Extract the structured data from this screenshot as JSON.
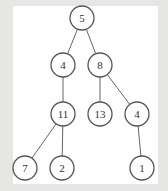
{
  "diagram": {
    "type": "binary-tree",
    "nodes": [
      {
        "id": "n5",
        "label": "5",
        "x": 82,
        "y": 18
      },
      {
        "id": "n4a",
        "label": "4",
        "x": 63,
        "y": 65
      },
      {
        "id": "n8",
        "label": "8",
        "x": 100,
        "y": 65
      },
      {
        "id": "n11",
        "label": "11",
        "x": 63,
        "y": 114
      },
      {
        "id": "n13",
        "label": "13",
        "x": 100,
        "y": 114
      },
      {
        "id": "n4b",
        "label": "4",
        "x": 137,
        "y": 114
      },
      {
        "id": "n7",
        "label": "7",
        "x": 25,
        "y": 168
      },
      {
        "id": "n2",
        "label": "2",
        "x": 62,
        "y": 168
      },
      {
        "id": "n1",
        "label": "1",
        "x": 142,
        "y": 168
      }
    ],
    "edges": [
      [
        "n5",
        "n4a"
      ],
      [
        "n5",
        "n8"
      ],
      [
        "n4a",
        "n11"
      ],
      [
        "n8",
        "n13"
      ],
      [
        "n8",
        "n4b"
      ],
      [
        "n11",
        "n7"
      ],
      [
        "n11",
        "n2"
      ],
      [
        "n4b",
        "n1"
      ]
    ]
  }
}
